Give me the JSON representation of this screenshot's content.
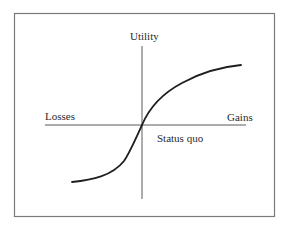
{
  "diagram": {
    "labels": {
      "y_axis": "Utility",
      "x_negative": "Losses",
      "x_positive": "Gains",
      "origin": "Status quo"
    },
    "colors": {
      "frame": "#7a7a7a",
      "axis": "#5a5a5a",
      "curve": "#1e1e1e",
      "text": "#2a2a2a",
      "background": "#ffffff"
    },
    "geometry": {
      "frame": {
        "x1": 14,
        "y1": 13,
        "x2": 275,
        "y2": 216
      },
      "origin": {
        "x": 142,
        "y": 125
      },
      "x_axis": {
        "from": 45,
        "to": 246
      },
      "y_axis": {
        "from": 46,
        "to": 199
      },
      "curve_start": {
        "x": 72,
        "y": 182
      },
      "curve_end": {
        "x": 241,
        "y": 65
      }
    }
  }
}
